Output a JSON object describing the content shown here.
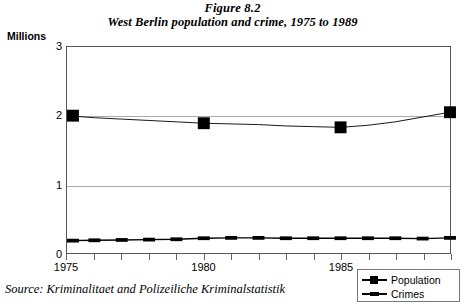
{
  "title": "Figure 8.2",
  "subtitle": "West Berlin population and crime, 1975 to 1989",
  "y_unit_label": "Millions",
  "source_note": "Source: Kriminalitaet and Polizeiliche Kriminalstatistik",
  "legend": {
    "items": [
      {
        "label": "Population",
        "symbol": "line-with-square-marker"
      },
      {
        "label": "Crimes",
        "symbol": "line-with-dash-marker"
      }
    ]
  },
  "chart_data": {
    "type": "line",
    "title": "Figure 8.2",
    "subtitle": "West Berlin population and crime, 1975 to 1989",
    "xlabel": "",
    "ylabel": "Millions",
    "ylim": [
      0,
      3
    ],
    "yticks": [
      0,
      1,
      2,
      3
    ],
    "ytick_labels": [
      "0",
      "1",
      "2",
      "3"
    ],
    "xlim": [
      1975,
      1989
    ],
    "x": [
      1975,
      1976,
      1977,
      1978,
      1979,
      1980,
      1981,
      1982,
      1983,
      1984,
      1985,
      1986,
      1987,
      1988,
      1989
    ],
    "xticks": [
      1975,
      1976,
      1977,
      1978,
      1979,
      1980,
      1981,
      1982,
      1983,
      1984,
      1985,
      1986,
      1987,
      1988,
      1989
    ],
    "xtick_labels_shown": [
      "1975",
      "1980",
      "1985"
    ],
    "xtick_label_years": [
      1975,
      1980,
      1985
    ],
    "grid": true,
    "grid_axis": "y",
    "legend_position": "bottom-right-outside",
    "series": [
      {
        "name": "Population",
        "marker": "square",
        "marker_years": [
          1975,
          1980,
          1985,
          1989
        ],
        "values": [
          2.0,
          1.97,
          1.95,
          1.93,
          1.91,
          1.89,
          1.88,
          1.87,
          1.85,
          1.84,
          1.83,
          1.86,
          1.91,
          1.98,
          2.05
        ]
      },
      {
        "name": "Crimes",
        "marker": "dash",
        "values": [
          0.18,
          0.185,
          0.19,
          0.195,
          0.2,
          0.215,
          0.22,
          0.22,
          0.215,
          0.215,
          0.215,
          0.215,
          0.215,
          0.21,
          0.22
        ]
      }
    ],
    "source": "Source: Kriminalitaet and Polizeiliche Kriminalstatistik"
  }
}
